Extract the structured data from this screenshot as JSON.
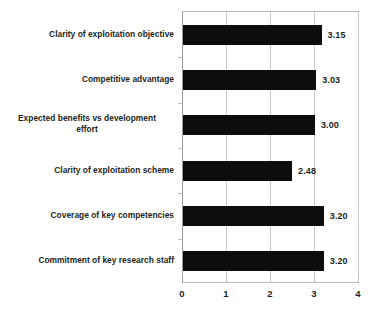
{
  "chart_data": {
    "type": "bar",
    "orientation": "horizontal",
    "title": "",
    "subtitle": "",
    "xlabel": "",
    "ylabel": "",
    "xlim": [
      0,
      4
    ],
    "xticks": [
      "0",
      "1",
      "2",
      "3",
      "4"
    ],
    "grid": true,
    "legend": false,
    "bar_color": "#0d0d0d",
    "gridline_color": "#c9c9c9",
    "axis_color": "#9b9b9b",
    "text_color": "#231f20",
    "categories": [
      "Clarity of exploitation objective",
      "Competitive advantage",
      "Expected benefits vs development effort",
      "Clarity of exploitation scheme",
      "Coverage of key competencies",
      "Commitment of key research staff"
    ],
    "category_lines": [
      [
        "Clarity of exploitation objective"
      ],
      [
        "Competitive advantage"
      ],
      [
        "Expected benefits vs development",
        "effort"
      ],
      [
        "Clarity of exploitation scheme"
      ],
      [
        "Coverage of key competencies"
      ],
      [
        "Commitment of key research staff"
      ]
    ],
    "values": [
      3.15,
      3.03,
      3.0,
      2.48,
      3.2,
      3.2
    ],
    "value_labels": [
      "3.15",
      "3.03",
      "3.00",
      "2.48",
      "3.20",
      "3.20"
    ]
  }
}
